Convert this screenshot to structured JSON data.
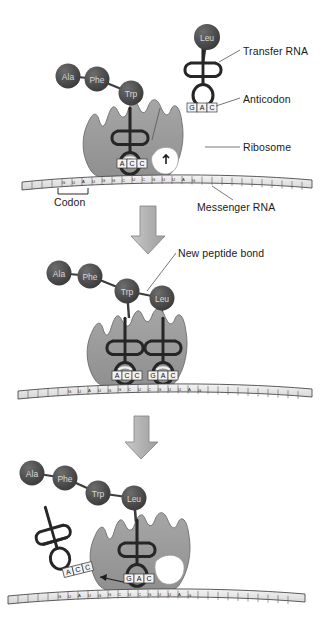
{
  "figure": {
    "background_color": "#ffffff"
  },
  "colors": {
    "ribosome_fill": "#9a9a9a",
    "ribosome_stroke": "#6e6e6e",
    "amino_acid_fill": "#4e4e4e",
    "amino_acid_text": "#d8d8d8",
    "trna_stroke": "#262626",
    "mrna_fill": "#e9e9e9",
    "mrna_stroke": "#4a4a4a",
    "arrow_fill": "#b5b5b5",
    "arrow_stroke": "#8a8a8a",
    "label_text": "#1a1a1a",
    "leader_line": "#555555",
    "anticodon_box_fill": "#f2f2f2"
  },
  "labels": [
    {
      "id": "transfer-rna",
      "text": "Transfer RNA",
      "x": 243,
      "y": 52
    },
    {
      "id": "anticodon",
      "text": "Anticodon",
      "x": 243,
      "y": 100
    },
    {
      "id": "ribosome",
      "text": "Ribosome",
      "x": 243,
      "y": 150
    },
    {
      "id": "codon",
      "text": "Codon",
      "x": 68,
      "y": 196
    },
    {
      "id": "messenger-rna",
      "text": "Messenger RNA",
      "x": 200,
      "y": 205
    },
    {
      "id": "new-peptide-bond",
      "text": "New peptide bond",
      "x": 178,
      "y": 255
    }
  ],
  "panels": [
    {
      "id": "panel-1",
      "name": "tRNA approaches ribosome",
      "amino_acids": [
        {
          "label": "Ala",
          "cx": 68,
          "cy": 76
        },
        {
          "label": "Phe",
          "cx": 97,
          "cy": 79
        },
        {
          "label": "Trp",
          "cx": 131,
          "cy": 93
        },
        {
          "label": "Leu",
          "cx": 207,
          "cy": 37
        }
      ],
      "trnas": [
        {
          "id": "trna-trp-bound",
          "anticodon": [
            "A",
            "C",
            "C"
          ],
          "state": "bound"
        },
        {
          "id": "trna-leu-free",
          "anticodon": [
            "G",
            "A",
            "C"
          ],
          "state": "incoming"
        }
      ],
      "ribosome_sites": [
        "P",
        "A"
      ]
    },
    {
      "id": "panel-2",
      "name": "Peptide bond forms between Trp and Leu",
      "amino_acids": [
        {
          "label": "Ala",
          "cx": 59,
          "cy": 273
        },
        {
          "label": "Phe",
          "cx": 90,
          "cy": 276
        },
        {
          "label": "Trp",
          "cx": 127,
          "cy": 291
        },
        {
          "label": "Leu",
          "cx": 162,
          "cy": 298
        }
      ],
      "trnas": [
        {
          "id": "trna-trp-p-site",
          "anticodon": [
            "A",
            "C",
            "C"
          ],
          "state": "bound"
        },
        {
          "id": "trna-leu-a-site",
          "anticodon": [
            "G",
            "A",
            "C"
          ],
          "state": "bound"
        }
      ]
    },
    {
      "id": "panel-3",
      "name": "tRNA released, ribosome translocates",
      "amino_acids": [
        {
          "label": "Ala",
          "cx": 32,
          "cy": 473
        },
        {
          "label": "Phe",
          "cx": 65,
          "cy": 478
        },
        {
          "label": "Trp",
          "cx": 98,
          "cy": 493
        },
        {
          "label": "Leu",
          "cx": 134,
          "cy": 498
        }
      ],
      "trnas": [
        {
          "id": "trna-released",
          "anticodon": [
            "A",
            "C",
            "C"
          ],
          "state": "released"
        },
        {
          "id": "trna-leu-p-site",
          "anticodon": [
            "G",
            "A",
            "C"
          ],
          "state": "bound"
        }
      ]
    }
  ],
  "arrows": [
    {
      "id": "arrow-1-to-2",
      "x": 148,
      "y_top": 206,
      "y_bottom": 252
    },
    {
      "id": "arrow-2-to-3",
      "x": 141,
      "y_top": 416,
      "y_bottom": 458
    }
  ],
  "mrna_sequence": "GUAUGGCUCGUUAGCCUAGUCAGGACUU",
  "mrna_strands": [
    {
      "id": "mrna-panel-1",
      "y": 178
    },
    {
      "id": "mrna-panel-2",
      "y": 388
    },
    {
      "id": "mrna-panel-3",
      "y": 593
    }
  ]
}
